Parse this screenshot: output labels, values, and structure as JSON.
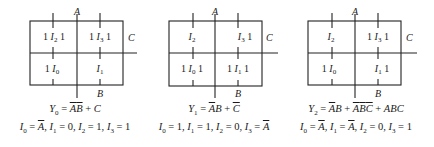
{
  "maps": [
    {
      "var_top": "A",
      "var_right": "C",
      "var_bottom": "B",
      "cells": {
        "top_left": {
          "pre": "1",
          "input": "I",
          "sub": "2",
          "post": "1"
        },
        "top_right": {
          "pre": "1",
          "input": "I",
          "sub": "3",
          "post": "1"
        },
        "bot_left": {
          "pre": "1",
          "input": "I",
          "sub": "0",
          "post": ""
        },
        "bot_right": {
          "pre": "",
          "input": "I",
          "sub": "1",
          "post": ""
        }
      },
      "equation": "Y₀ = A̅B̅ + C",
      "equation_parts": {
        "lhs": "Y",
        "lhs_sub": "0"
      },
      "inputs": "I₀ = A̅, I₁ = 0, I₂ = 1, I₃ = 1"
    },
    {
      "var_top": "A",
      "var_right": "C",
      "var_bottom": "B",
      "cells": {
        "top_left": {
          "pre": "",
          "input": "I",
          "sub": "2",
          "post": ""
        },
        "top_right": {
          "pre": "",
          "input": "I",
          "sub": "3",
          "post": "1"
        },
        "bot_left": {
          "pre": "1",
          "input": "I",
          "sub": "0",
          "post": "1"
        },
        "bot_right": {
          "pre": "1",
          "input": "I",
          "sub": "1",
          "post": "1"
        }
      },
      "equation": "Y₁ = A̅B + C̅",
      "equation_parts": {
        "lhs": "Y",
        "lhs_sub": "1"
      },
      "inputs": "I₀ = 1, I₁ = 1, I₂ = 0, I₃ = A̅"
    },
    {
      "var_top": "A",
      "var_right": "C",
      "var_bottom": "B",
      "cells": {
        "top_left": {
          "pre": "",
          "input": "I",
          "sub": "2",
          "post": ""
        },
        "top_right": {
          "pre": "1",
          "input": "I",
          "sub": "3",
          "post": "1"
        },
        "bot_left": {
          "pre": "1",
          "input": "I",
          "sub": "0",
          "post": ""
        },
        "bot_right": {
          "pre": "",
          "input": "I",
          "sub": "1",
          "post": "1"
        }
      },
      "equation": "Y₂ = A̅B + A̅B̅C̅ + ABC",
      "equation_parts": {
        "lhs": "Y",
        "lhs_sub": "2"
      },
      "inputs": "I₀ = A̅, I₁ = A̅, I₂ = 0, I₃ = 1"
    }
  ],
  "colors": {
    "ink": "#222222",
    "background": "#ffffff"
  }
}
